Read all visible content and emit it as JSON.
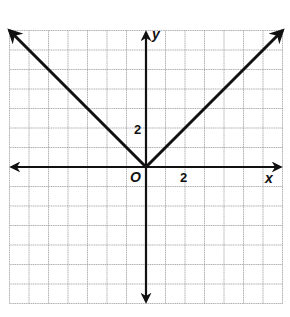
{
  "chart_data": {
    "type": "line",
    "title": "",
    "function": "y = |x|",
    "xlabel": "x",
    "ylabel": "y",
    "origin_label": "O",
    "tick_labels": {
      "x": [
        {
          "value": 2,
          "label": "2"
        }
      ],
      "y": [
        {
          "value": 2,
          "label": "2"
        }
      ]
    },
    "xlim": [
      -7,
      7
    ],
    "ylim": [
      -7,
      7
    ],
    "grid": true,
    "grid_step": 1,
    "series": [
      {
        "name": "y = |x|",
        "points": [
          [
            -7,
            7
          ],
          [
            0,
            0
          ],
          [
            7,
            7
          ]
        ],
        "arrows_at_ends": true
      }
    ],
    "legend": null
  },
  "labels": {
    "x_axis": "x",
    "y_axis": "y",
    "origin": "O",
    "x_tick": "2",
    "y_tick": "2"
  },
  "colors": {
    "background": "#ffffff",
    "grid": "#9a9a9a",
    "axis": "#111111",
    "curve": "#111111"
  }
}
